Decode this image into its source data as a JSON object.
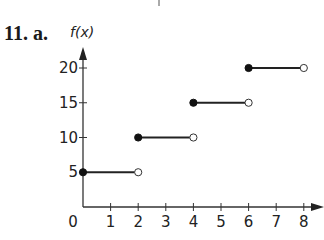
{
  "problem": {
    "label": "11. a."
  },
  "chart_data": {
    "type": "line",
    "subtype": "step-function",
    "title": "",
    "xlabel": "",
    "ylabel": "f(x)",
    "xlim": [
      0,
      8
    ],
    "ylim": [
      0,
      20
    ],
    "x_ticks": [
      "0",
      "1",
      "2",
      "3",
      "4",
      "5",
      "6",
      "7",
      "8"
    ],
    "y_ticks": [
      "5",
      "10",
      "15",
      "20"
    ],
    "grid": false,
    "legend": null,
    "segments": [
      {
        "x_start": 0,
        "x_end": 2,
        "y": 5,
        "start_closed": true,
        "end_closed": false
      },
      {
        "x_start": 2,
        "x_end": 4,
        "y": 10,
        "start_closed": true,
        "end_closed": false
      },
      {
        "x_start": 4,
        "x_end": 6,
        "y": 15,
        "start_closed": true,
        "end_closed": false
      },
      {
        "x_start": 6,
        "x_end": 8,
        "y": 20,
        "start_closed": true,
        "end_closed": false
      }
    ]
  }
}
